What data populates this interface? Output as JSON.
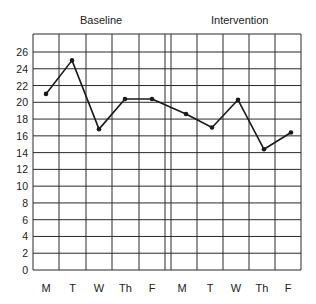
{
  "chart_data": {
    "type": "line",
    "title": "",
    "phases": [
      {
        "name": "Baseline",
        "categories": [
          "M",
          "T",
          "W",
          "Th",
          "F"
        ],
        "values": [
          21,
          25,
          16.8,
          20.4,
          20.4
        ]
      },
      {
        "name": "Intervention",
        "categories": [
          "M",
          "T",
          "W",
          "Th",
          "F"
        ],
        "values": [
          18.6,
          17,
          20.3,
          14.4,
          16.4
        ]
      }
    ],
    "categories": [
      "M",
      "T",
      "W",
      "Th",
      "F",
      "M",
      "T",
      "W",
      "Th",
      "F"
    ],
    "series": [
      {
        "name": "Score",
        "values": [
          21,
          25,
          16.8,
          20.4,
          20.4,
          18.6,
          17,
          20.3,
          14.4,
          16.4
        ]
      }
    ],
    "xlabel": "",
    "ylabel": "",
    "ylim": [
      0,
      28
    ],
    "yticks": [
      0,
      2,
      4,
      6,
      8,
      10,
      12,
      14,
      16,
      18,
      20,
      22,
      24,
      26
    ],
    "grid": true,
    "phase_divider_after_index": 4,
    "legend": null
  },
  "labels": {
    "baseline": "Baseline",
    "intervention": "Intervention"
  },
  "colors": {
    "line": "#1a1a1a",
    "grid": "#2a2a2a",
    "background": "#ffffff"
  }
}
